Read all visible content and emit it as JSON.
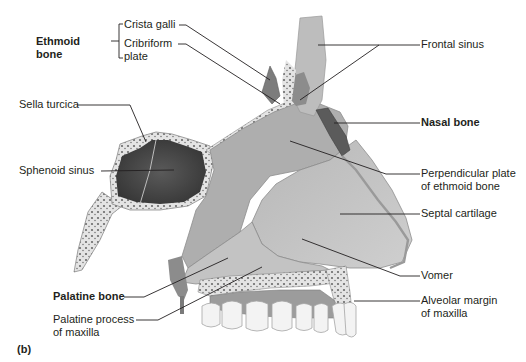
{
  "figure": {
    "panel_label": "(b)",
    "colors": {
      "background": "#ffffff",
      "text": "#231f20",
      "leader_line": "#231f20",
      "bone_light": "#c9c9c9",
      "bone_mid": "#a9a9a9",
      "sinus_dark": "#4a4a4a",
      "nasal_bone": "#5b5b5b",
      "cartilage": "#bdbdbd",
      "spongy": "#e6e6e6",
      "teeth": "#f2f2f2"
    }
  },
  "labels": {
    "ethmoid_group": {
      "title_line1": "Ethmoid",
      "title_line2": "bone"
    },
    "crista_galli": "Crista galli",
    "cribriform_line1": "Cribriform",
    "cribriform_line2": "plate",
    "sella_turcica": "Sella turcica",
    "sphenoid_sinus": "Sphenoid sinus",
    "palatine_bone": "Palatine bone",
    "palatine_process_line1": "Palatine process",
    "palatine_process_line2": "of maxilla",
    "frontal_sinus": "Frontal sinus",
    "nasal_bone": "Nasal bone",
    "perpendicular_line1": "Perpendicular plate",
    "perpendicular_line2": "of ethmoid bone",
    "septal_cartilage": "Septal cartilage",
    "vomer": "Vomer",
    "alveolar_line1": "Alveolar margin",
    "alveolar_line2": "of maxilla"
  }
}
